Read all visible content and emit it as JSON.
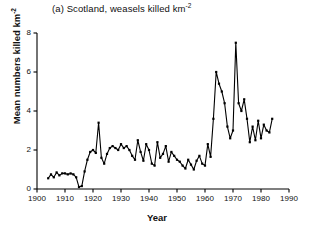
{
  "chart_data": {
    "type": "line",
    "title": "(a) Scotland, weasels killed km",
    "title_sup": "-2",
    "xlabel": "Year",
    "ylabel": "Mean numbers killed km",
    "ylabel_sup": "-2",
    "xlim": [
      1900,
      1990
    ],
    "ylim": [
      0,
      8
    ],
    "xticks": [
      1900,
      1910,
      1920,
      1930,
      1940,
      1950,
      1960,
      1970,
      1980,
      1990
    ],
    "yticks": [
      0,
      2,
      4,
      6,
      8
    ],
    "grid": false,
    "legend": false,
    "marker": "square",
    "line_color": "#000000",
    "x": [
      1904,
      1905,
      1906,
      1907,
      1908,
      1909,
      1910,
      1911,
      1912,
      1913,
      1914,
      1915,
      1916,
      1917,
      1918,
      1919,
      1920,
      1921,
      1922,
      1923,
      1924,
      1925,
      1926,
      1927,
      1928,
      1929,
      1930,
      1931,
      1932,
      1933,
      1934,
      1935,
      1936,
      1937,
      1938,
      1939,
      1940,
      1941,
      1942,
      1943,
      1944,
      1945,
      1946,
      1947,
      1948,
      1949,
      1950,
      1951,
      1952,
      1953,
      1954,
      1955,
      1956,
      1957,
      1958,
      1959,
      1960,
      1961,
      1962,
      1963,
      1964,
      1965,
      1966,
      1967,
      1968,
      1969,
      1970,
      1971,
      1972,
      1973,
      1974,
      1975,
      1976,
      1977,
      1978,
      1979,
      1980,
      1981,
      1982,
      1983,
      1984
    ],
    "values": [
      0.55,
      0.75,
      0.6,
      0.85,
      0.7,
      0.8,
      0.8,
      0.75,
      0.8,
      0.75,
      0.6,
      0.1,
      0.15,
      0.9,
      1.5,
      1.9,
      2.0,
      1.85,
      3.4,
      1.6,
      1.3,
      1.8,
      2.1,
      2.2,
      2.1,
      2.0,
      2.3,
      2.1,
      2.2,
      2.0,
      1.7,
      1.5,
      2.5,
      1.9,
      1.45,
      2.3,
      2.0,
      1.3,
      1.2,
      2.4,
      1.6,
      1.8,
      2.2,
      1.4,
      1.9,
      1.7,
      1.5,
      1.4,
      1.2,
      1.05,
      1.5,
      1.25,
      1.0,
      1.45,
      1.7,
      1.3,
      1.2,
      2.3,
      1.65,
      3.6,
      6.0,
      5.4,
      5.0,
      4.4,
      3.2,
      2.6,
      3.0,
      7.5,
      4.4,
      4.0,
      4.6,
      3.6,
      2.4,
      3.2,
      2.5,
      3.5,
      2.6,
      3.3,
      3.0,
      2.9,
      3.6
    ]
  },
  "axes": {
    "y_tick_labels": [
      "0",
      "2",
      "4",
      "6",
      "8"
    ],
    "x_tick_labels": [
      "1900",
      "1910",
      "1920",
      "1930",
      "1940",
      "1950",
      "1960",
      "1970",
      "1980",
      "1990"
    ]
  }
}
